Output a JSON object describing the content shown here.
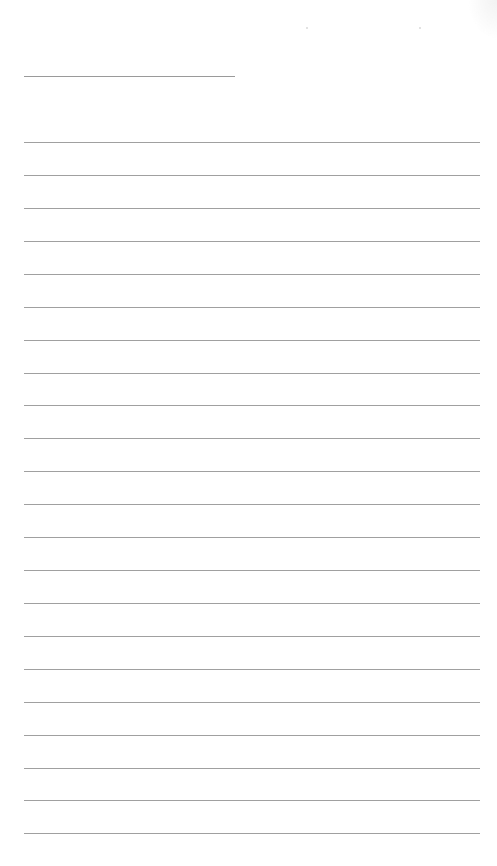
{
  "document": {
    "type": "lined-writing-sheet",
    "title_line": {
      "x": 24,
      "y": 76,
      "width": 211
    },
    "ruled_lines": {
      "x": 24,
      "width": 456,
      "positions_y": [
        142,
        175,
        208,
        241,
        274,
        307,
        340,
        373,
        405,
        438,
        471,
        504,
        537,
        570,
        603,
        636,
        669,
        702,
        735,
        768,
        800,
        833
      ]
    },
    "line_color": "#a0a0a0",
    "background_color": "#ffffff",
    "text_content": ""
  }
}
